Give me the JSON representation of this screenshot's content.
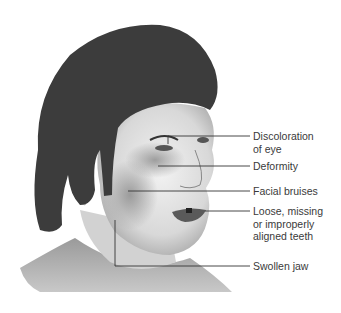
{
  "figure": {
    "labels": [
      {
        "id": "eye",
        "lines": [
          "Discoloration",
          "of eye"
        ]
      },
      {
        "id": "deformity",
        "lines": [
          "Deformity"
        ]
      },
      {
        "id": "bruises",
        "lines": [
          "Facial bruises"
        ]
      },
      {
        "id": "teeth",
        "lines": [
          "Loose, missing",
          "or improperly",
          "aligned teeth"
        ]
      },
      {
        "id": "jaw",
        "lines": [
          "Swollen jaw"
        ]
      }
    ]
  }
}
